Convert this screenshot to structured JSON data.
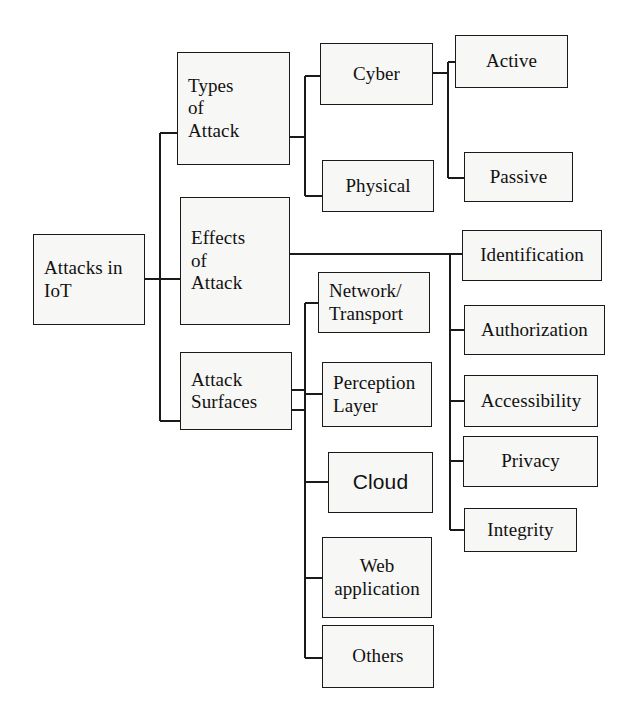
{
  "diagram": {
    "stroke_color": "#1a1a1a",
    "node_fill": "#f7f7f5",
    "background": "#ffffff",
    "root": {
      "label": "Attacks in\nIoT"
    },
    "branches": [
      {
        "label": "Types\nof\nAttack",
        "children": [
          {
            "label": "Cyber",
            "children": [
              {
                "label": "Active"
              },
              {
                "label": "Passive"
              }
            ]
          },
          {
            "label": "Physical",
            "children": []
          }
        ]
      },
      {
        "label": "Effects\nof\nAttack",
        "children": [
          {
            "label": "Identification"
          },
          {
            "label": "Authorization"
          },
          {
            "label": "Accessibility"
          },
          {
            "label": "Privacy"
          },
          {
            "label": "Integrity"
          }
        ]
      },
      {
        "label": "Attack\nSurfaces",
        "children": [
          {
            "label": "Network/\nTransport"
          },
          {
            "label": "Perception\nLayer"
          },
          {
            "label": "Cloud"
          },
          {
            "label": "Web\napplication"
          },
          {
            "label": "Others"
          }
        ]
      }
    ]
  }
}
